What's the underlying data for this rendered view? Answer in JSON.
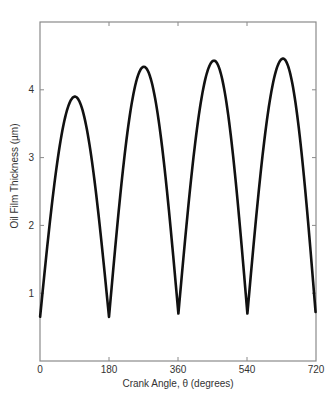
{
  "chart_data": {
    "type": "line",
    "title": "",
    "xlabel": "Crank Angle, θ (degrees)",
    "ylabel": "Oil Film Thickness  (µm)",
    "xlim": [
      0,
      720
    ],
    "ylim": [
      0,
      5
    ],
    "x_ticks": [
      0,
      180,
      360,
      540,
      720
    ],
    "x_tick_labels": [
      "0",
      "180",
      "360",
      "540",
      "720"
    ],
    "y_ticks": [
      1,
      2,
      3,
      4
    ],
    "y_tick_labels": [
      "1",
      "2",
      "3",
      "4"
    ],
    "grid": false,
    "legend": null,
    "series": [
      {
        "name": "Oil film thickness",
        "color": "#111111",
        "extrema": [
          {
            "x": -2,
            "y": 0.52,
            "kind": "min"
          },
          {
            "x": 91,
            "y": 3.9,
            "kind": "max"
          },
          {
            "x": 180,
            "y": 0.65,
            "kind": "min"
          },
          {
            "x": 271,
            "y": 4.34,
            "kind": "max"
          },
          {
            "x": 361,
            "y": 0.7,
            "kind": "min"
          },
          {
            "x": 454,
            "y": 4.43,
            "kind": "max"
          },
          {
            "x": 541,
            "y": 0.7,
            "kind": "min"
          },
          {
            "x": 634,
            "y": 4.46,
            "kind": "max"
          },
          {
            "x": 721,
            "y": 0.57,
            "kind": "min"
          }
        ],
        "x": [
          0,
          45,
          91,
          135,
          180,
          225,
          271,
          315,
          361,
          405,
          454,
          500,
          541,
          585,
          634,
          680,
          720
        ],
        "values": [
          0.56,
          2.9,
          3.9,
          2.9,
          0.65,
          3.1,
          4.34,
          3.35,
          0.7,
          3.15,
          4.43,
          3.45,
          0.7,
          3.2,
          4.46,
          3.3,
          0.58
        ]
      }
    ]
  }
}
